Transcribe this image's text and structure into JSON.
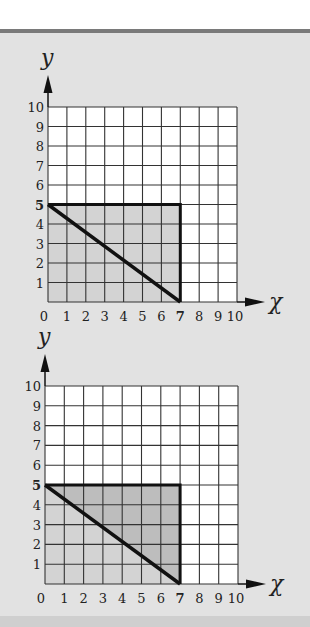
{
  "colors": {
    "panel_bg": "#e2e2e2",
    "top_bar": "#7a7a7a",
    "grid_fill": "#ffffff",
    "grid_line": "#333333",
    "shade_light": "#d3d3d3",
    "shade_dark": "#bdbdbd",
    "outline": "#111111"
  },
  "graphs": [
    {
      "y_label": "y",
      "x_label": "χ",
      "x_ticks": [
        "0",
        "1",
        "2",
        "3",
        "4",
        "5",
        "6",
        "7",
        "8",
        "9",
        "10"
      ],
      "y_ticks": [
        "1",
        "2",
        "3",
        "4",
        "5",
        "6",
        "7",
        "8",
        "9",
        "10"
      ],
      "bold_x_tick": "7",
      "bold_y_tick": "5",
      "rectangle": {
        "x0": 0,
        "y0": 0,
        "x1": 7,
        "y1": 5
      },
      "diagonal": {
        "from": [
          0,
          5
        ],
        "to": [
          7,
          0
        ]
      },
      "shading": "whole rectangle uniformly shaded"
    },
    {
      "y_label": "y",
      "x_label": "χ",
      "x_ticks": [
        "0",
        "1",
        "2",
        "3",
        "4",
        "5",
        "6",
        "7",
        "8",
        "9",
        "10"
      ],
      "y_ticks": [
        "1",
        "2",
        "3",
        "4",
        "5",
        "6",
        "7",
        "8",
        "9",
        "10"
      ],
      "bold_x_tick": "7",
      "bold_y_tick": "5",
      "rectangle": {
        "x0": 0,
        "y0": 0,
        "x1": 7,
        "y1": 5
      },
      "diagonal": {
        "from": [
          0,
          5
        ],
        "to": [
          7,
          0
        ]
      },
      "shading": "rectangle lightly shaded, upper triangle above diagonal darker"
    }
  ],
  "chart_data": [
    {
      "type": "diagram",
      "title": "",
      "xlabel": "χ",
      "ylabel": "y",
      "xlim": [
        0,
        10
      ],
      "ylim": [
        0,
        10
      ],
      "grid": true,
      "shapes": [
        {
          "kind": "rectangle",
          "vertices": [
            [
              0,
              0
            ],
            [
              7,
              0
            ],
            [
              7,
              5
            ],
            [
              0,
              5
            ]
          ],
          "fill": "shaded"
        },
        {
          "kind": "line",
          "from": [
            0,
            5
          ],
          "to": [
            7,
            0
          ]
        }
      ],
      "highlighted_ticks": {
        "x": 7,
        "y": 5
      }
    },
    {
      "type": "diagram",
      "title": "",
      "xlabel": "χ",
      "ylabel": "y",
      "xlim": [
        0,
        10
      ],
      "ylim": [
        0,
        10
      ],
      "grid": true,
      "shapes": [
        {
          "kind": "triangle",
          "vertices": [
            [
              0,
              0
            ],
            [
              7,
              0
            ],
            [
              0,
              5
            ]
          ],
          "fill": "light"
        },
        {
          "kind": "triangle",
          "vertices": [
            [
              0,
              5
            ],
            [
              7,
              5
            ],
            [
              7,
              0
            ]
          ],
          "fill": "dark"
        },
        {
          "kind": "rectangle",
          "vertices": [
            [
              0,
              0
            ],
            [
              7,
              0
            ],
            [
              7,
              5
            ],
            [
              0,
              5
            ]
          ],
          "fill": "none"
        },
        {
          "kind": "line",
          "from": [
            0,
            5
          ],
          "to": [
            7,
            0
          ]
        }
      ],
      "highlighted_ticks": {
        "x": 7,
        "y": 5
      }
    }
  ]
}
